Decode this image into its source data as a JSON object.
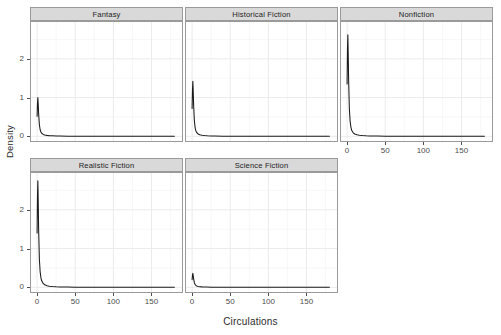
{
  "chart_data": {
    "type": "line",
    "title": "",
    "subtitle": "",
    "xlabel": "Circulations",
    "ylabel": "Density",
    "xlim": [
      -8,
      190
    ],
    "ylim": [
      -0.12,
      2.95
    ],
    "grid": true,
    "legend": false,
    "facet_layout": {
      "rows": 2,
      "cols": 3,
      "facet_variable": "genre"
    },
    "x_ticks": [
      0,
      50,
      100,
      150
    ],
    "x_tick_labels": [
      "0",
      "50",
      "100",
      "150"
    ],
    "y_ticks": [
      0,
      1,
      2
    ],
    "y_tick_labels": [
      "0",
      "1",
      "2"
    ],
    "series": [
      {
        "name": "Fantasy",
        "peak_density": 1.0,
        "peak_x": 1,
        "x": [
          0,
          0.5,
          1,
          1.5,
          2,
          3,
          4,
          5,
          6,
          8,
          10,
          13,
          16,
          20,
          25,
          30,
          40,
          50,
          60,
          80,
          100,
          120,
          140,
          160,
          180
        ],
        "values": [
          0.52,
          0.86,
          1.0,
          0.82,
          0.58,
          0.3,
          0.17,
          0.11,
          0.08,
          0.05,
          0.035,
          0.025,
          0.018,
          0.013,
          0.009,
          0.007,
          0.005,
          0.004,
          0.003,
          0.002,
          0.0015,
          0.001,
          0.0008,
          0.0006,
          0.0005
        ]
      },
      {
        "name": "Historical Fiction",
        "peak_density": 1.42,
        "peak_x": 1,
        "x": [
          0,
          0.5,
          1,
          1.5,
          2,
          3,
          4,
          5,
          6,
          8,
          10,
          13,
          16,
          20,
          25,
          30,
          40,
          50,
          60,
          80,
          100,
          120,
          140,
          160,
          180
        ],
        "values": [
          0.72,
          1.2,
          1.42,
          1.15,
          0.8,
          0.4,
          0.22,
          0.14,
          0.1,
          0.06,
          0.04,
          0.028,
          0.02,
          0.014,
          0.01,
          0.008,
          0.005,
          0.004,
          0.003,
          0.002,
          0.0015,
          0.001,
          0.0008,
          0.0006,
          0.0005
        ]
      },
      {
        "name": "Nonfiction",
        "peak_density": 2.62,
        "peak_x": 1,
        "x": [
          0,
          0.5,
          1,
          1.5,
          2,
          3,
          4,
          5,
          6,
          8,
          10,
          13,
          16,
          20,
          25,
          30,
          40,
          50,
          60,
          80,
          100,
          120,
          140,
          160,
          180
        ],
        "values": [
          1.35,
          2.25,
          2.62,
          2.1,
          1.45,
          0.7,
          0.38,
          0.24,
          0.16,
          0.09,
          0.06,
          0.04,
          0.028,
          0.02,
          0.014,
          0.01,
          0.007,
          0.005,
          0.004,
          0.003,
          0.002,
          0.0015,
          0.001,
          0.0008,
          0.0006
        ]
      },
      {
        "name": "Realistic Fiction",
        "peak_density": 2.75,
        "peak_x": 1,
        "x": [
          0,
          0.5,
          1,
          1.5,
          2,
          3,
          4,
          5,
          6,
          8,
          10,
          13,
          16,
          20,
          25,
          30,
          40,
          50,
          60,
          80,
          100,
          120,
          140,
          160,
          180
        ],
        "values": [
          1.4,
          2.35,
          2.75,
          2.2,
          1.5,
          0.72,
          0.4,
          0.25,
          0.17,
          0.1,
          0.065,
          0.042,
          0.03,
          0.021,
          0.015,
          0.011,
          0.007,
          0.005,
          0.004,
          0.003,
          0.002,
          0.0015,
          0.001,
          0.0008,
          0.0006
        ]
      },
      {
        "name": "Science Fiction",
        "peak_density": 0.36,
        "peak_x": 1,
        "x": [
          0,
          0.5,
          1,
          1.5,
          2,
          3,
          4,
          5,
          6,
          8,
          10,
          13,
          16,
          20,
          25,
          30,
          40,
          50,
          60,
          80,
          100,
          120,
          140,
          160,
          180
        ],
        "values": [
          0.2,
          0.31,
          0.36,
          0.3,
          0.22,
          0.12,
          0.07,
          0.05,
          0.036,
          0.024,
          0.017,
          0.012,
          0.009,
          0.007,
          0.005,
          0.004,
          0.003,
          0.002,
          0.0018,
          0.0012,
          0.001,
          0.0008,
          0.0006,
          0.0005,
          0.0004
        ]
      }
    ]
  },
  "axes": {
    "y_title": "Density",
    "x_title": "Circulations",
    "x_tick_labels": [
      "0",
      "50",
      "100",
      "150"
    ],
    "y_tick_labels": [
      "0",
      "1",
      "2"
    ]
  },
  "facets": [
    {
      "label": "Fantasy",
      "series_index": 0,
      "row": 0,
      "col": 0
    },
    {
      "label": "Historical Fiction",
      "series_index": 1,
      "row": 0,
      "col": 1
    },
    {
      "label": "Nonfiction",
      "series_index": 2,
      "row": 0,
      "col": 2
    },
    {
      "label": "Realistic Fiction",
      "series_index": 3,
      "row": 1,
      "col": 0
    },
    {
      "label": "Science Fiction",
      "series_index": 4,
      "row": 1,
      "col": 1
    }
  ],
  "style": {
    "curve_color": "#1a1a1a",
    "grid_major_color": "#ebebeb",
    "grid_minor_color": "#f4f4f4",
    "panel_bg": "#ffffff",
    "panel_border": "#9a9a9a",
    "strip_bg": "#d9d9d9",
    "text_color": "#2b2b2b",
    "tick_color": "#4d4d4d"
  }
}
